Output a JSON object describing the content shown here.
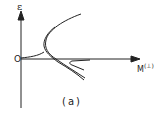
{
  "figure": {
    "y_axis_label": "ε",
    "origin_label": "O",
    "x_axis_label": "M",
    "x_axis_superscript": "(⊥)",
    "caption": "(a)"
  },
  "colors": {
    "ink": "#222222",
    "background": "#ffffff"
  }
}
